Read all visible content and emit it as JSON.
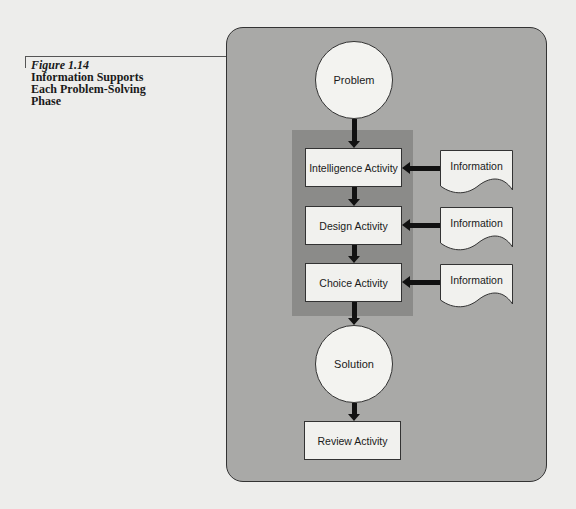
{
  "caption": {
    "figure_number": "Figure 1.14",
    "title_lines": [
      "Information Supports",
      "Each Problem-Solving",
      "Phase"
    ]
  },
  "diagram": {
    "start_node": "Problem",
    "activities": [
      {
        "label": "Intelligence Activity",
        "input": "Information"
      },
      {
        "label": "Design Activity",
        "input": "Information"
      },
      {
        "label": "Choice Activity",
        "input": "Information"
      }
    ],
    "end_node": "Solution",
    "review": "Review Activity"
  },
  "colors": {
    "page_background": "#ededeb",
    "outer_panel": "#a9a9a7",
    "inner_panel": "#8b8b89",
    "node_fill": "#f1f1ee",
    "arrow": "#111111"
  }
}
